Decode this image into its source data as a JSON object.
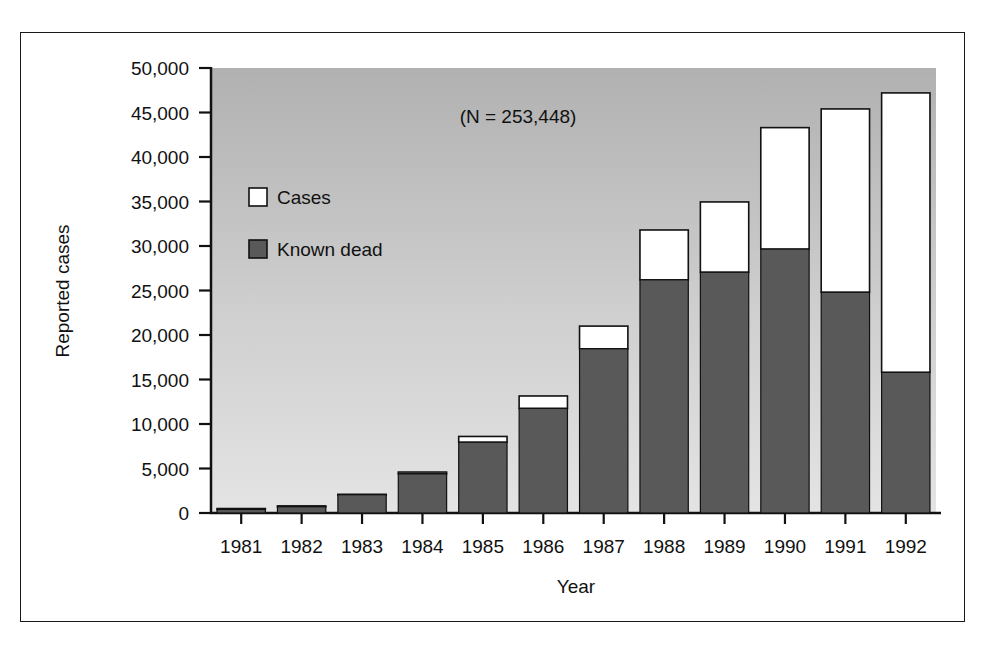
{
  "figure": {
    "annotation": "(N = 253,448)",
    "plot_bg_top": "#b3b3b3",
    "plot_bg_bottom": "#e2e2e2",
    "dark_fill": "#595959",
    "light_fill": "#ffffff",
    "axis_color": "#111111"
  },
  "legend": {
    "position": "inside-top-left",
    "entries": [
      {
        "label": "Cases",
        "swatch": "#ffffff"
      },
      {
        "label": "Known dead",
        "swatch": "#595959"
      }
    ]
  },
  "chart_data": {
    "type": "bar",
    "stacked": true,
    "title": "",
    "subtitle": "",
    "annotation": "(N = 253,448)",
    "xlabel": "Year",
    "ylabel": "Reported cases",
    "xlim_categories": 12,
    "ylim": [
      0,
      50000
    ],
    "ytick_step": 5000,
    "grid": false,
    "legend_position": "inside-top-left",
    "categories": [
      "1981",
      "1982",
      "1983",
      "1984",
      "1985",
      "1986",
      "1987",
      "1988",
      "1989",
      "1990",
      "1991",
      "1992"
    ],
    "ytick_labels": [
      "0",
      "5,000",
      "10,000",
      "15,000",
      "20,000",
      "25,000",
      "30,000",
      "35,000",
      "40,000",
      "45,000",
      "50,000"
    ],
    "series": [
      {
        "name": "Known dead",
        "color": "#595959",
        "values": [
          400,
          700,
          2050,
          4400,
          7950,
          11750,
          18450,
          26200,
          27050,
          29650,
          24800,
          15800
        ]
      },
      {
        "name": "Cases",
        "color": "#ffffff",
        "note": "segment drawn above 'Known dead'; value below is the remainder to bar total",
        "values": [
          100,
          100,
          50,
          200,
          650,
          1400,
          2550,
          5600,
          7900,
          13650,
          20600,
          31400
        ]
      }
    ],
    "totals": [
      500,
      800,
      2100,
      4600,
      8600,
      13150,
      21000,
      31800,
      34950,
      43300,
      45400,
      47200
    ]
  }
}
